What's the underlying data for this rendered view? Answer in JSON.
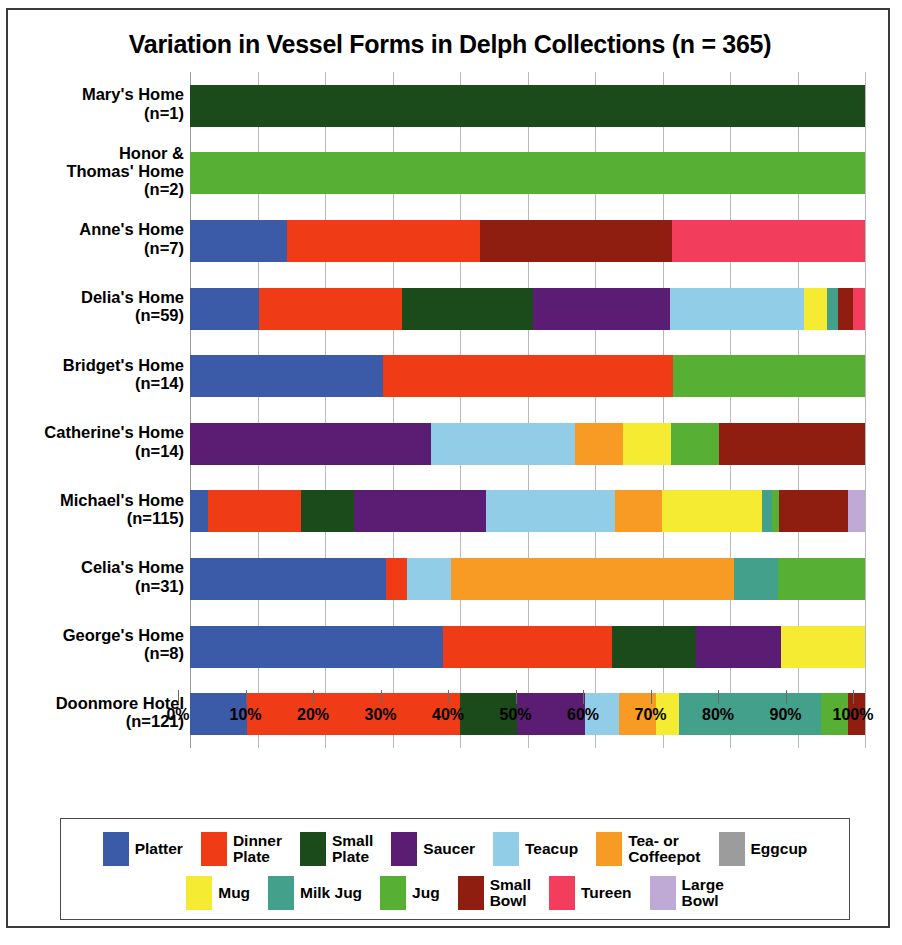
{
  "chart_data": {
    "type": "bar",
    "subtype": "horizontal-stacked-100-percent",
    "title": "Variation in Vessel Forms in Delph Collections (n = 365)",
    "xlabel": "",
    "ylabel": "",
    "xlim": [
      0,
      100
    ],
    "xtick_labels": [
      "0%",
      "10%",
      "20%",
      "30%",
      "40%",
      "50%",
      "60%",
      "70%",
      "80%",
      "90%",
      "100%"
    ],
    "xtick_values": [
      0,
      10,
      20,
      30,
      40,
      50,
      60,
      70,
      80,
      90,
      100
    ],
    "grid": true,
    "legend_position": "bottom",
    "categories": [
      {
        "name": "Mary's Home",
        "count": "(n=1)",
        "n": 1
      },
      {
        "name": "Honor &\nThomas' Home",
        "count": "(n=2)",
        "n": 2
      },
      {
        "name": "Anne's Home",
        "count": "(n=7)",
        "n": 7
      },
      {
        "name": "Delia's Home",
        "count": "(n=59)",
        "n": 59
      },
      {
        "name": "Bridget's Home",
        "count": "(n=14)",
        "n": 14
      },
      {
        "name": "Catherine's Home",
        "count": "(n=14)",
        "n": 14
      },
      {
        "name": "Michael's Home",
        "count": "(n=115)",
        "n": 115
      },
      {
        "name": "Celia's Home",
        "count": "(n=31)",
        "n": 31
      },
      {
        "name": "George's Home",
        "count": "(n=8)",
        "n": 8
      },
      {
        "name": "Doonmore Hotel",
        "count": "(n=121)",
        "n": 121
      }
    ],
    "series": [
      {
        "name": "Platter",
        "color": "#3B5AA8",
        "values": [
          0,
          0,
          14.3,
          10.2,
          28.6,
          0,
          2.6,
          29.0,
          37.5,
          8.5
        ]
      },
      {
        "name": "Dinner\nPlate",
        "color": "#F03C16",
        "values": [
          0,
          0,
          28.6,
          21.2,
          42.9,
          0,
          13.9,
          3.2,
          25.0,
          31.5
        ]
      },
      {
        "name": "Small\nPlate",
        "color": "#1B4A1B",
        "values": [
          100,
          0,
          0,
          19.5,
          0,
          0,
          7.8,
          0,
          12.5,
          8.5
        ]
      },
      {
        "name": "Saucer",
        "color": "#5B1D73",
        "values": [
          0,
          0,
          0,
          20.3,
          0,
          35.7,
          19.6,
          0,
          12.5,
          10.0
        ]
      },
      {
        "name": "Teacup",
        "color": "#92CDE8",
        "values": [
          0,
          0,
          0,
          19.8,
          0,
          21.4,
          19.1,
          6.5,
          0,
          5.0
        ]
      },
      {
        "name": "Tea- or\nCoffeepot",
        "color": "#F79B24",
        "values": [
          0,
          0,
          0,
          0,
          0,
          7.1,
          7.0,
          41.9,
          0,
          5.5
        ]
      },
      {
        "name": "Eggcup",
        "color": "#9C9C9C",
        "values": [
          0,
          0,
          0,
          0,
          0,
          0,
          0,
          0,
          0,
          0
        ]
      },
      {
        "name": "Mug",
        "color": "#F5EB33",
        "values": [
          0,
          0,
          0,
          3.4,
          0,
          7.1,
          14.8,
          0,
          12.5,
          3.5
        ]
      },
      {
        "name": "Milk Jug",
        "color": "#43A08A",
        "values": [
          0,
          0,
          0,
          1.7,
          0,
          0,
          1.4,
          6.5,
          0,
          21.0
        ]
      },
      {
        "name": "Jug",
        "color": "#57B033",
        "values": [
          0,
          100,
          0,
          0,
          28.5,
          7.1,
          1.0,
          12.9,
          0,
          4.0
        ]
      },
      {
        "name": "Small\nBowl",
        "color": "#8F1E10",
        "values": [
          0,
          0,
          28.5,
          2.2,
          0,
          21.6,
          10.3,
          0,
          0,
          2.5
        ]
      },
      {
        "name": "Tureen",
        "color": "#F23E5C",
        "values": [
          0,
          0,
          28.6,
          1.8,
          0,
          0,
          0,
          0,
          0,
          0
        ]
      },
      {
        "name": "Large\nBowl",
        "color": "#BFA9D6",
        "values": [
          0,
          0,
          0,
          0,
          0,
          0,
          2.5,
          0,
          0,
          0
        ]
      }
    ]
  },
  "legend": {
    "row1": [
      {
        "label": "Platter",
        "color": "#3B5AA8"
      },
      {
        "label": "Dinner\nPlate",
        "color": "#F03C16"
      },
      {
        "label": "Small\nPlate",
        "color": "#1B4A1B"
      },
      {
        "label": "Saucer",
        "color": "#5B1D73"
      },
      {
        "label": "Teacup",
        "color": "#92CDE8"
      },
      {
        "label": "Tea- or\nCoffeepot",
        "color": "#F79B24"
      },
      {
        "label": "Eggcup",
        "color": "#9C9C9C"
      }
    ],
    "row2": [
      {
        "label": "Mug",
        "color": "#F5EB33"
      },
      {
        "label": "Milk Jug",
        "color": "#43A08A"
      },
      {
        "label": "Jug",
        "color": "#57B033"
      },
      {
        "label": "Small\nBowl",
        "color": "#8F1E10"
      },
      {
        "label": "Tureen",
        "color": "#F23E5C"
      },
      {
        "label": "Large\nBowl",
        "color": "#BFA9D6"
      }
    ]
  }
}
